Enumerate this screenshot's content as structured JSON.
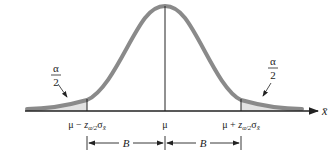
{
  "diagram": {
    "type": "normal-distribution-confidence-interval",
    "colors": {
      "curve": "#8a8a8a",
      "tail_fill": "#e2e2e2",
      "axis": "#222222",
      "text": "#222222"
    },
    "tail_label_left": {
      "numerator": "α",
      "denominator": "2"
    },
    "tail_label_right": {
      "numerator": "α",
      "denominator": "2"
    },
    "axis_variable": "x̄",
    "ticks": {
      "left": {
        "mu": "μ",
        "sign": " − ",
        "z": "z",
        "sub_z": "α/2",
        "sigma": "σ",
        "sub_sigma": "x̄"
      },
      "center": "μ",
      "right": {
        "mu": "μ",
        "sign": " + ",
        "z": "z",
        "sub_z": "α/2",
        "sigma": "σ",
        "sub_sigma": "x̄"
      }
    },
    "bound_left_label": "B",
    "bound_right_label": "B"
  }
}
